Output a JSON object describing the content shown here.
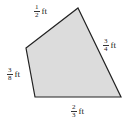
{
  "figure": {
    "shape": "quadrilateral",
    "fill_color": "#dcdcdc",
    "stroke_color": "#222222",
    "sides": [
      {
        "id": "top",
        "numerator": "1",
        "denominator": "2",
        "unit": "ft"
      },
      {
        "id": "right",
        "numerator": "3",
        "denominator": "4",
        "unit": "ft"
      },
      {
        "id": "left",
        "numerator": "3",
        "denominator": "8",
        "unit": "ft"
      },
      {
        "id": "bottom",
        "numerator": "2",
        "denominator": "3",
        "unit": "ft"
      }
    ]
  }
}
